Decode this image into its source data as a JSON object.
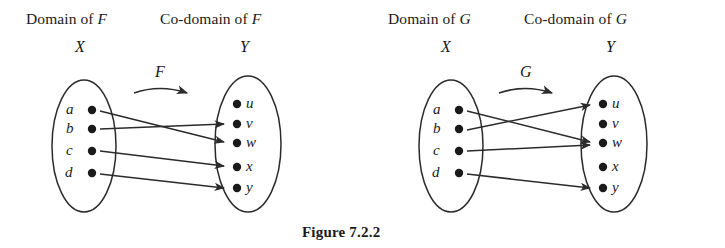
{
  "caption": "Figure 7.2.2",
  "panels": [
    {
      "id": "panel-F",
      "function_name": "F",
      "domain_header": "Domain of F",
      "codomain_header": "Co-domain of F",
      "domain_set_label": "X",
      "codomain_set_label": "Y",
      "domain_elements": [
        "a",
        "b",
        "c",
        "d"
      ],
      "codomain_elements": [
        "u",
        "v",
        "w",
        "x",
        "y"
      ],
      "mappings": [
        {
          "from": "a",
          "to": "w"
        },
        {
          "from": "b",
          "to": "v"
        },
        {
          "from": "c",
          "to": "x"
        },
        {
          "from": "d",
          "to": "y"
        }
      ]
    },
    {
      "id": "panel-G",
      "function_name": "G",
      "domain_header": "Domain of G",
      "codomain_header": "Co-domain of G",
      "domain_set_label": "X",
      "codomain_set_label": "Y",
      "domain_elements": [
        "a",
        "b",
        "c",
        "d"
      ],
      "codomain_elements": [
        "u",
        "v",
        "w",
        "x",
        "y"
      ],
      "mappings": [
        {
          "from": "a",
          "to": "w"
        },
        {
          "from": "b",
          "to": "u"
        },
        {
          "from": "c",
          "to": "w"
        },
        {
          "from": "d",
          "to": "y"
        }
      ]
    }
  ],
  "colors": {
    "ink": "#2b2b2b",
    "background": "#ffffff"
  }
}
